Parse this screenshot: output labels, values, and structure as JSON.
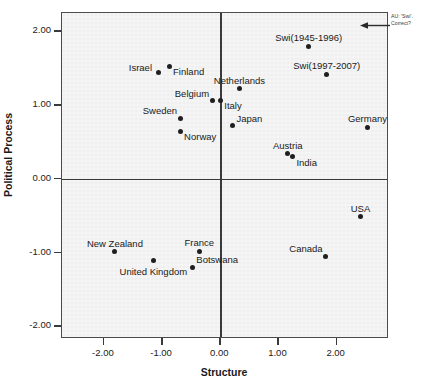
{
  "chart_data": {
    "type": "scatter",
    "title": "",
    "xlabel": "Structure",
    "ylabel": "Political Process",
    "xlim": [
      -2.72,
      2.9
    ],
    "ylim": [
      -2.17,
      2.25
    ],
    "xticks": [
      "-2.00",
      "-1.00",
      "0.00",
      "1.00",
      "2.00"
    ],
    "xtick_values": [
      -2,
      -1,
      0,
      1,
      2
    ],
    "yticks": [
      "2.00",
      "1.00",
      "0.00",
      "-1.00",
      "-2.00"
    ],
    "ytick_values": [
      2,
      1,
      0,
      -1,
      -2
    ],
    "grid": false,
    "legend": "none",
    "reference_lines": {
      "x": 0,
      "y": 0
    },
    "points": [
      {
        "label": "Israel",
        "x": -1.07,
        "y": 1.45,
        "label_pos": "left"
      },
      {
        "label": "Finland",
        "x": -0.88,
        "y": 1.53,
        "label_pos": "below-right"
      },
      {
        "label": "Netherlands",
        "x": 0.33,
        "y": 1.22,
        "label_pos": "above"
      },
      {
        "label": "Belgium",
        "x": -0.14,
        "y": 1.06,
        "label_pos": "above-left"
      },
      {
        "label": "Italy",
        "x": 0.0,
        "y": 1.07,
        "label_pos": "below-right"
      },
      {
        "label": "Sweden",
        "x": -0.69,
        "y": 0.82,
        "label_pos": "above-left"
      },
      {
        "label": "Norway",
        "x": -0.69,
        "y": 0.65,
        "label_pos": "below-right"
      },
      {
        "label": "Japan",
        "x": 0.21,
        "y": 0.72,
        "label_pos": "above-right"
      },
      {
        "label": "Germany",
        "x": 2.53,
        "y": 0.7,
        "label_pos": "above"
      },
      {
        "label": "Swi(1945-1996)",
        "x": 1.52,
        "y": 1.8,
        "label_pos": "above"
      },
      {
        "label": "Swi(1997-2007)",
        "x": 1.83,
        "y": 1.42,
        "label_pos": "above"
      },
      {
        "label": "Austria",
        "x": 1.16,
        "y": 0.34,
        "label_pos": "above"
      },
      {
        "label": "India",
        "x": 1.24,
        "y": 0.3,
        "label_pos": "below-right"
      },
      {
        "label": "USA",
        "x": 2.41,
        "y": -0.51,
        "label_pos": "above"
      },
      {
        "label": "Canada",
        "x": 1.81,
        "y": -1.05,
        "label_pos": "above-left"
      },
      {
        "label": "New Zealand",
        "x": -1.81,
        "y": -0.99,
        "label_pos": "above"
      },
      {
        "label": "United Kingdom",
        "x": -1.15,
        "y": -1.11,
        "label_pos": "below"
      },
      {
        "label": "France",
        "x": -0.36,
        "y": -0.98,
        "label_pos": "above"
      },
      {
        "label": "Botswana",
        "x": -0.48,
        "y": -1.2,
        "label_pos": "above-right"
      }
    ]
  },
  "annotation": {
    "line1": "AU: 'Swi'.",
    "line2": "Correct?"
  }
}
